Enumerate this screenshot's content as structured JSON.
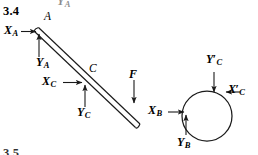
{
  "figure": {
    "problem_number": "3.4",
    "next_problem_number": "3.5",
    "clipped_top_label": "Y",
    "clipped_top_sub": "A",
    "caption": "Free-body diagrams of an inclined bar AB and a circular disc",
    "stroke_color": "#1a1a1a",
    "background_color": "#ffffff"
  },
  "bar": {
    "point_a_label": "A",
    "point_c_label": "C",
    "description": "slender two-line bar from A (upper left) down to B (lower right)",
    "start": {
      "x": 34,
      "y": 31
    },
    "end": {
      "x": 136,
      "y": 127
    }
  },
  "disc": {
    "center_x": 207,
    "center_y": 116,
    "radius": 25
  },
  "forces": [
    {
      "id": "XA",
      "symbol": "X",
      "sub": "A",
      "prime": false,
      "label_x": 4,
      "label_y": 28,
      "direction": "right",
      "applied_at": "A"
    },
    {
      "id": "YA",
      "symbol": "Y",
      "sub": "A",
      "prime": false,
      "label_x": 38,
      "label_y": 60,
      "direction": "up",
      "applied_at": "A"
    },
    {
      "id": "XC",
      "symbol": "X",
      "sub": "C",
      "prime": false,
      "label_x": 44,
      "label_y": 76,
      "direction": "right",
      "applied_at": "C"
    },
    {
      "id": "YC",
      "symbol": "Y",
      "sub": "C",
      "prime": false,
      "label_x": 79,
      "label_y": 110,
      "direction": "up",
      "applied_at": "C"
    },
    {
      "id": "F",
      "symbol": "F",
      "sub": "",
      "prime": false,
      "label_x": 130,
      "label_y": 70,
      "direction": "down",
      "applied_at": "bar mid-right"
    },
    {
      "id": "XB",
      "symbol": "X",
      "sub": "B",
      "prime": false,
      "label_x": 150,
      "label_y": 105,
      "direction": "right",
      "applied_at": "B (disc left)"
    },
    {
      "id": "YB",
      "symbol": "Y",
      "sub": "B",
      "prime": false,
      "label_x": 178,
      "label_y": 138,
      "direction": "up",
      "applied_at": "B (disc bottom-left)"
    },
    {
      "id": "YCprime",
      "symbol": "Y",
      "sub": "C",
      "prime": true,
      "label_x": 208,
      "label_y": 57,
      "direction": "down",
      "applied_at": "disc top"
    },
    {
      "id": "XCprime",
      "symbol": "X",
      "sub": "C",
      "prime": true,
      "label_x": 230,
      "label_y": 85,
      "direction": "left",
      "applied_at": "disc right"
    }
  ]
}
